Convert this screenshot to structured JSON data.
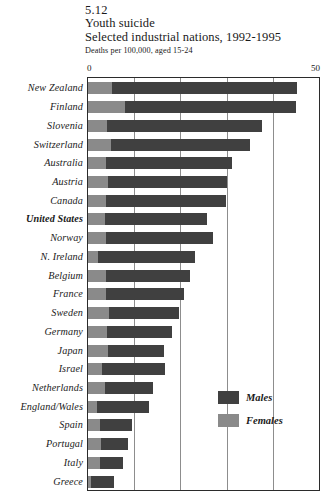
{
  "header": {
    "figure_number": "5.12",
    "title": "Youth suicide",
    "subtitle": "Selected industrial nations, 1992-1995",
    "units": "Deaths per 100,000, aged 15-24"
  },
  "axis": {
    "min_label": "0",
    "max_label": "50"
  },
  "legend": {
    "males_label": "Males",
    "females_label": "Females"
  },
  "colors": {
    "males": "#404040",
    "females": "#8a8a8a",
    "frame": "#2b2b2b",
    "gridline": "#8d8d8d",
    "background": "#ffffff"
  },
  "chart_data": {
    "type": "bar",
    "orientation": "horizontal",
    "stacked": true,
    "title": "Youth suicide",
    "subtitle": "Selected industrial nations, 1992-1995",
    "xlabel": "Deaths per 100,000, aged 15-24",
    "ylabel": "",
    "xlim": [
      0,
      50
    ],
    "xticks": [
      0,
      50
    ],
    "grid": "vertical gridlines every 10 units",
    "legend_position": "inside-right-bottom",
    "categories": [
      "New Zealand",
      "Finland",
      "Slovenia",
      "Switzerland",
      "Australia",
      "Austria",
      "Canada",
      "United States",
      "Norway",
      "N. Ireland",
      "Belgium",
      "France",
      "Sweden",
      "Germany",
      "Japan",
      "Israel",
      "Netherlands",
      "England/Wales",
      "Spain",
      "Portugal",
      "Italy",
      "Greece"
    ],
    "highlighted_category": "United States",
    "series": [
      {
        "name": "Females",
        "values": [
          5.2,
          8.0,
          4.1,
          5.0,
          4.0,
          4.3,
          3.9,
          3.6,
          4.0,
          2.1,
          3.8,
          4.0,
          4.6,
          4.2,
          4.3,
          3.1,
          3.6,
          2.0,
          2.5,
          2.8,
          2.6,
          0.6
        ]
      },
      {
        "name": "Males",
        "values": [
          40.0,
          37.0,
          33.6,
          30.0,
          27.1,
          25.7,
          25.9,
          22.1,
          23.0,
          21.1,
          18.3,
          16.8,
          15.2,
          14.0,
          12.2,
          13.6,
          10.4,
          11.1,
          7.0,
          5.9,
          5.0,
          5.0
        ]
      }
    ],
    "totals": [
      45.2,
      45.0,
      37.7,
      35.0,
      31.1,
      30.0,
      29.8,
      25.7,
      27.0,
      23.2,
      22.1,
      20.8,
      19.8,
      18.2,
      16.5,
      16.7,
      14.0,
      13.1,
      9.5,
      8.7,
      7.6,
      5.6
    ]
  }
}
